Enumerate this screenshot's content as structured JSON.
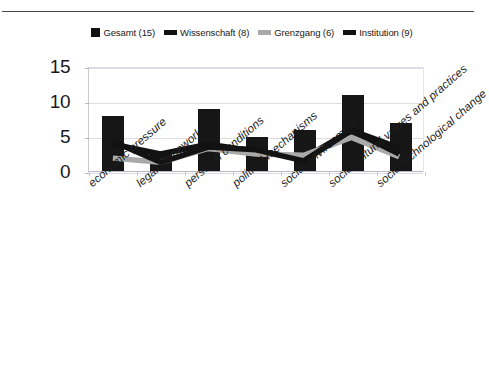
{
  "chart_data": {
    "type": "bar",
    "title": "",
    "subtitle": "",
    "xlabel": "",
    "ylabel": "",
    "ylim": [
      0,
      15
    ],
    "yticks": [
      "0",
      "5",
      "10",
      "15"
    ],
    "ytick_values": [
      0,
      5,
      10,
      15
    ],
    "grid": true,
    "legend_position": "top",
    "categories": [
      "economic pressure",
      "legal framework",
      "personal conditions",
      "political mechanisms",
      "social environment",
      "socio-cultural values and practices",
      "socio-technological change"
    ],
    "series": [
      {
        "name": "Gesamt (15)",
        "render": "bar",
        "color": "#161616",
        "values": [
          8,
          3,
          9,
          5,
          6,
          11,
          7
        ]
      },
      {
        "name": "Wissenschaft (8)",
        "render": "line",
        "color": "#121212",
        "values": [
          4,
          2.6,
          4,
          3,
          2,
          6,
          3.5
        ]
      },
      {
        "name": "Grenzgang (6)",
        "render": "line",
        "color": "#a9a9a9",
        "values": [
          2,
          1.4,
          3.4,
          2.6,
          2.4,
          5,
          2.2
        ]
      },
      {
        "name": "Institution (9)",
        "render": "line",
        "color": "#121212",
        "values": [
          4.4,
          1.4,
          3.6,
          3.2,
          1.6,
          6,
          2.6
        ]
      }
    ],
    "legend": [
      {
        "label": "Gesamt (15)",
        "marker": "square",
        "color": "#161616"
      },
      {
        "label": "Wissenschaft (8)",
        "marker": "line",
        "color": "#121212"
      },
      {
        "label": "Grenzgang (6)",
        "marker": "line",
        "color": "#a9a9a9"
      },
      {
        "label": "Institution (9)",
        "marker": "line",
        "color": "#121212"
      }
    ]
  }
}
